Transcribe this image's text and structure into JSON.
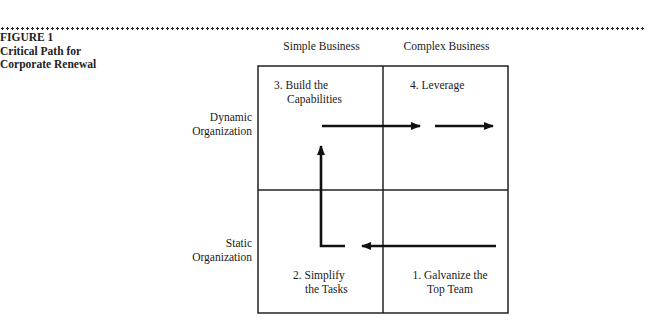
{
  "figure": {
    "number": "FIGURE 1",
    "title_line1": "Critical Path for",
    "title_line2": "Corporate Renewal"
  },
  "columns": [
    "Simple Business",
    "Complex Business"
  ],
  "rows": [
    {
      "line1": "Dynamic",
      "line2": "Organization"
    },
    {
      "line1": "Static",
      "line2": "Organization"
    }
  ],
  "cells": {
    "top_left": {
      "line1": "3. Build the",
      "line2": "Capabilities"
    },
    "top_right": {
      "line1": "4. Leverage"
    },
    "bottom_left": {
      "line1": "2. Simplify",
      "line2": "the Tasks"
    },
    "bottom_right": {
      "line1": "1. Galvanize the",
      "line2": "Top Team"
    }
  },
  "path_sequence": [
    "1. Galvanize the Top Team",
    "2. Simplify the Tasks",
    "3. Build the Capabilities",
    "4. Leverage"
  ],
  "colors": {
    "line": "#222222",
    "arrow": "#111111"
  }
}
